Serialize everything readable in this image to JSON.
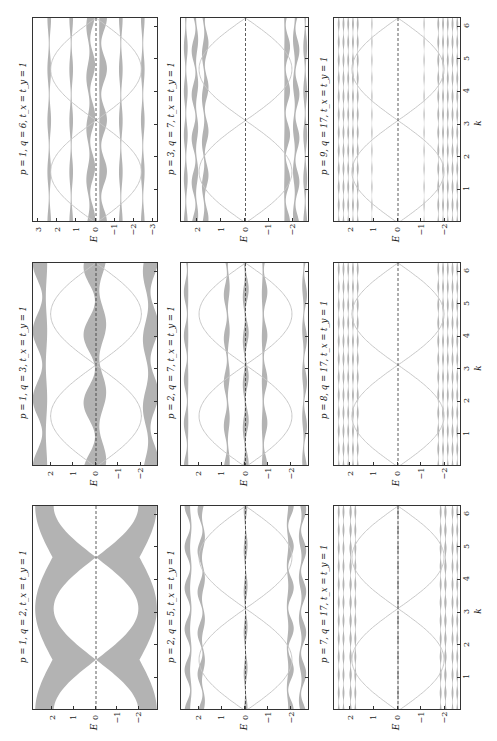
{
  "figure": {
    "common_param": "t_x = t_y = 1",
    "xlabel": "E",
    "ylabel": "k",
    "band_color": "#b3b3b3",
    "line_color": "#c8c8c8",
    "frame_color": "#333333"
  },
  "chart_data": [
    {
      "id": "p1q6",
      "type": "line",
      "title": "p = 1, q = 6, t_x = t_y = 1",
      "p": 1,
      "q": 6,
      "xlabel": "E",
      "ylabel": "k",
      "xlim": [
        3.3,
        -3.3
      ],
      "xticks": [
        3,
        2,
        1,
        0,
        -1,
        -2,
        -3
      ],
      "ylim": [
        0,
        6.283
      ],
      "yticks": [
        1,
        2,
        3,
        4,
        5,
        6
      ],
      "bands": [
        {
          "center": 2.45,
          "width": 0.12
        },
        {
          "center": 1.3,
          "width": 0.12
        },
        {
          "center": 0.3,
          "width": 0.25,
          "osc": 0.25
        },
        {
          "center": -0.3,
          "width": 0.25,
          "osc": 0.25
        },
        {
          "center": -1.3,
          "width": 0.12
        },
        {
          "center": -2.45,
          "width": 0.12
        }
      ],
      "edge_states": true,
      "dashed_zero": true
    },
    {
      "id": "p3q7",
      "type": "line",
      "title": "p = 3, q = 7, t_x = t_y = 1",
      "p": 3,
      "q": 7,
      "xlabel": "E",
      "ylabel": "k",
      "xlim": [
        2.7,
        -2.7
      ],
      "xticks": [
        2,
        1,
        0,
        -1,
        -2
      ],
      "ylim": [
        0,
        6.283
      ],
      "yticks": [
        1,
        2,
        3,
        4,
        5,
        6
      ],
      "bands": [
        {
          "center": 2.5,
          "width": 0.1
        },
        {
          "center": 2.1,
          "width": 0.15,
          "osc": 0.15
        },
        {
          "center": 1.7,
          "width": 0.15,
          "osc": 0.15
        },
        {
          "center": -1.7,
          "width": 0.15,
          "osc": 0.15
        },
        {
          "center": -2.1,
          "width": 0.15,
          "osc": 0.15
        },
        {
          "center": -2.5,
          "width": 0.1
        }
      ],
      "edge_states": true,
      "dashed_zero": true
    },
    {
      "id": "p9q17",
      "type": "line",
      "title": "p = 9, q = 17, t_x = t_y = 1",
      "p": 9,
      "q": 17,
      "xlabel": "E",
      "ylabel": "k",
      "xlim": [
        2.7,
        -2.7
      ],
      "xticks": [
        2,
        1,
        0,
        -1,
        -2
      ],
      "ylim": [
        0,
        6.283
      ],
      "yticks": [
        1,
        2,
        3,
        4,
        5,
        6
      ],
      "bands": [
        {
          "center": 2.5,
          "width": 0.05
        },
        {
          "center": 2.3,
          "width": 0.05
        },
        {
          "center": 2.1,
          "width": 0.05
        },
        {
          "center": 1.9,
          "width": 0.05
        },
        {
          "center": 1.7,
          "width": 0.05
        },
        {
          "center": 1.1,
          "width": 0.03
        },
        {
          "center": -1.1,
          "width": 0.03
        },
        {
          "center": -1.7,
          "width": 0.05
        },
        {
          "center": -1.9,
          "width": 0.05
        },
        {
          "center": -2.1,
          "width": 0.05
        },
        {
          "center": -2.3,
          "width": 0.05
        },
        {
          "center": -2.5,
          "width": 0.05
        }
      ],
      "edge_states": true,
      "dashed_zero": true
    },
    {
      "id": "p1q3",
      "type": "line",
      "title": "p = 1, q = 3, t_x = t_y = 1",
      "p": 1,
      "q": 3,
      "xlabel": "E",
      "ylabel": "k",
      "xlim": [
        2.8,
        -2.8
      ],
      "xticks": [
        2,
        1,
        0,
        -1,
        -2
      ],
      "ylim": [
        0,
        6.283
      ],
      "yticks": [
        1,
        2,
        3,
        4,
        5,
        6
      ],
      "bands": [
        {
          "center": 2.4,
          "width": 0.4,
          "osc": 0.3
        },
        {
          "center": 0.0,
          "width": 0.6,
          "osc": 0.35
        },
        {
          "center": -2.4,
          "width": 0.4,
          "osc": 0.3
        }
      ],
      "edge_states": true,
      "dashed_zero": true
    },
    {
      "id": "p2q7",
      "type": "line",
      "title": "p = 2, q = 7, t_x = t_y = 1",
      "p": 2,
      "q": 7,
      "xlabel": "E",
      "ylabel": "k",
      "xlim": [
        2.8,
        -2.8
      ],
      "xticks": [
        2,
        1,
        0,
        -1,
        -2
      ],
      "ylim": [
        0,
        6.283
      ],
      "yticks": [
        1,
        2,
        3,
        4,
        5,
        6
      ],
      "bands": [
        {
          "center": 2.55,
          "width": 0.12,
          "osc": 0.1
        },
        {
          "center": 0.8,
          "width": 0.15,
          "osc": 0.1
        },
        {
          "center": 0.0,
          "width": 0.15,
          "osc": 0.1
        },
        {
          "center": -0.8,
          "width": 0.15,
          "osc": 0.1
        },
        {
          "center": -2.55,
          "width": 0.12,
          "osc": 0.1
        }
      ],
      "edge_states": true,
      "dashed_zero": true
    },
    {
      "id": "p8q17",
      "type": "line",
      "title": "p = 8, q = 17, t_x = t_y = 1",
      "p": 8,
      "q": 17,
      "xlabel": "E",
      "ylabel": "k",
      "xlim": [
        2.7,
        -2.7
      ],
      "xticks": [
        2,
        1,
        0,
        -1,
        -2
      ],
      "ylim": [
        0,
        6.283
      ],
      "yticks": [
        1,
        2,
        3,
        4,
        5,
        6
      ],
      "bands": [
        {
          "center": 2.5,
          "width": 0.05
        },
        {
          "center": 2.3,
          "width": 0.05
        },
        {
          "center": 2.1,
          "width": 0.05
        },
        {
          "center": 1.9,
          "width": 0.05
        },
        {
          "center": 1.7,
          "width": 0.05
        },
        {
          "center": -1.7,
          "width": 0.05
        },
        {
          "center": -1.9,
          "width": 0.05
        },
        {
          "center": -2.1,
          "width": 0.05
        },
        {
          "center": -2.3,
          "width": 0.05
        },
        {
          "center": -2.5,
          "width": 0.05
        }
      ],
      "edge_states": true,
      "dashed_zero": true
    },
    {
      "id": "p1q2",
      "type": "area",
      "title": "p = 1, q = 2, t_x = t_y = 1",
      "p": 1,
      "q": 2,
      "xlabel": "E",
      "ylabel": "k",
      "xlim": [
        2.9,
        -2.9
      ],
      "xticks": [
        2,
        1,
        0,
        -1,
        -2
      ],
      "ylim": [
        0,
        6.283
      ],
      "yticks": [
        1,
        2,
        3,
        4,
        5,
        6
      ],
      "bands": [
        {
          "type": "dirac"
        }
      ],
      "dirac_points_k": [
        1.57,
        4.71
      ],
      "edge_states": false,
      "dashed_zero": true
    },
    {
      "id": "p2q5",
      "type": "line",
      "title": "p = 2, q = 5, t_x = t_y = 1",
      "p": 2,
      "q": 5,
      "xlabel": "E",
      "ylabel": "k",
      "xlim": [
        2.8,
        -2.8
      ],
      "xticks": [
        2,
        1,
        0,
        -1,
        -2
      ],
      "ylim": [
        0,
        6.283
      ],
      "yticks": [
        1,
        2,
        3,
        4,
        5,
        6
      ],
      "bands": [
        {
          "center": 2.45,
          "width": 0.15,
          "osc": 0.25
        },
        {
          "center": 1.9,
          "width": 0.15,
          "osc": 0.25
        },
        {
          "center": 0.0,
          "width": 0.1,
          "osc": 0.05
        },
        {
          "center": -1.9,
          "width": 0.15,
          "osc": 0.25
        },
        {
          "center": -2.45,
          "width": 0.15,
          "osc": 0.25
        }
      ],
      "edge_states": true,
      "dashed_zero": true
    },
    {
      "id": "p7q17",
      "type": "line",
      "title": "p = 7, q = 17, t_x = t_y = 1",
      "p": 7,
      "q": 17,
      "xlabel": "E",
      "ylabel": "k",
      "xlim": [
        2.7,
        -2.7
      ],
      "xticks": [
        2,
        1,
        0,
        -1,
        -2
      ],
      "ylim": [
        0,
        6.283
      ],
      "yticks": [
        1,
        2,
        3,
        4,
        5,
        6
      ],
      "bands": [
        {
          "center": 2.5,
          "width": 0.05
        },
        {
          "center": 2.3,
          "width": 0.05
        },
        {
          "center": 2.0,
          "width": 0.06
        },
        {
          "center": 1.8,
          "width": 0.05
        },
        {
          "center": 0.0,
          "width": 0.05
        },
        {
          "center": -1.8,
          "width": 0.05
        },
        {
          "center": -2.0,
          "width": 0.06
        },
        {
          "center": -2.3,
          "width": 0.05
        },
        {
          "center": -2.5,
          "width": 0.05
        }
      ],
      "edge_states": true,
      "dashed_zero": true
    }
  ],
  "layout": {
    "columns_x": [
      [
        32,
        158
      ],
      [
        180,
        309
      ],
      [
        333,
        461
      ]
    ],
    "rows_y": [
      [
        17,
        222
      ],
      [
        262,
        466
      ],
      [
        505,
        710
      ]
    ],
    "order": [
      [
        "p1q6",
        "p3q7",
        "p9q17"
      ],
      [
        "p1q3",
        "p2q7",
        "p8q17"
      ],
      [
        "p1q2",
        "p2q5",
        "p7q17"
      ]
    ]
  },
  "k_tick_labels": [
    "1",
    "2",
    "3",
    "4",
    "5",
    "6"
  ]
}
